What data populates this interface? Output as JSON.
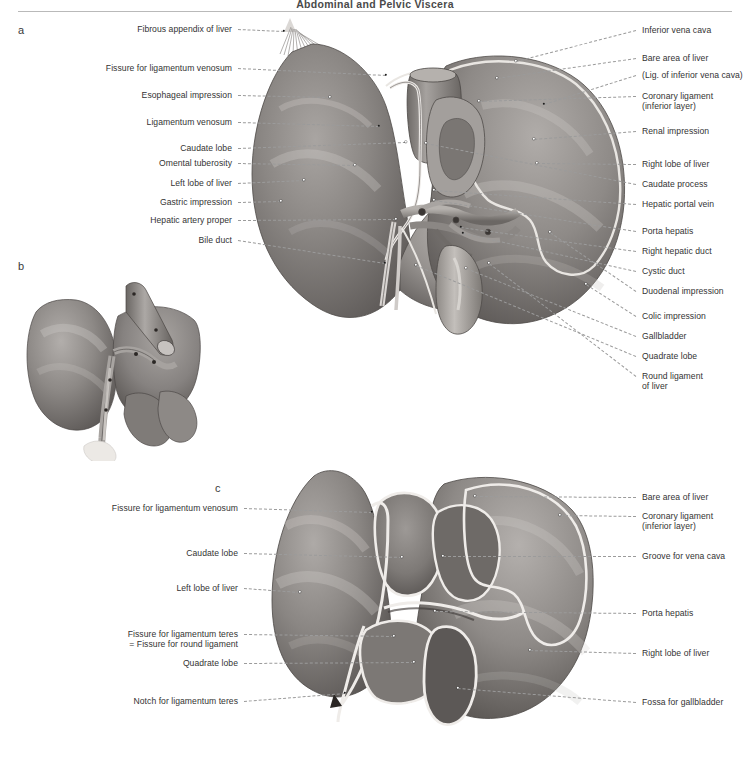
{
  "page": {
    "running_head": "Abdominal and Pelvic Viscera",
    "width": 750,
    "height": 767,
    "background": "#ffffff",
    "leader_color": "#9b9b9b",
    "text_color": "#333333"
  },
  "panels": [
    {
      "letter": "a",
      "x": 18,
      "y": 30,
      "caption": ""
    },
    {
      "letter": "b",
      "x": 18,
      "y": 266,
      "caption": ""
    },
    {
      "letter": "c",
      "x": 215,
      "y": 489,
      "caption": ""
    }
  ],
  "panel_a": {
    "letter": "a",
    "labels_left": [
      {
        "text": "Fibrous appendix of liver",
        "x": 232,
        "y": 29,
        "tx": 284,
        "ty": 31,
        "dot": "dark"
      },
      {
        "text": "Fissure for ligamentum venosum",
        "x": 232,
        "y": 68,
        "tx": 386,
        "ty": 75,
        "dot": "dark"
      },
      {
        "text": "Esophageal impression",
        "x": 232,
        "y": 95,
        "tx": 330,
        "ty": 97,
        "dot": "light"
      },
      {
        "text": "Ligamentum venosum",
        "x": 232,
        "y": 122,
        "tx": 379,
        "ty": 126,
        "dot": "dark"
      },
      {
        "text": "Caudate lobe",
        "x": 232,
        "y": 148,
        "tx": 406,
        "ty": 142,
        "dot": "light"
      },
      {
        "text": "Omental tuberosity",
        "x": 232,
        "y": 163,
        "tx": 355,
        "ty": 165,
        "dot": "light"
      },
      {
        "text": "Left lobe of liver",
        "x": 232,
        "y": 183,
        "tx": 304,
        "ty": 180,
        "dot": "light"
      },
      {
        "text": "Gastric impression",
        "x": 232,
        "y": 202,
        "tx": 281,
        "ty": 201,
        "dot": "light"
      },
      {
        "text": "Hepatic artery proper",
        "x": 232,
        "y": 220,
        "tx": 396,
        "ty": 219,
        "dot": "light"
      },
      {
        "text": "Bile duct",
        "x": 232,
        "y": 240,
        "tx": 385,
        "ty": 263,
        "dot": "dark"
      }
    ],
    "labels_right": [
      {
        "text": "Inferior vena cava",
        "x": 642,
        "y": 30,
        "tx": 516,
        "ty": 61,
        "dot": "light"
      },
      {
        "text": "Bare area of liver",
        "x": 642,
        "y": 58,
        "tx": 497,
        "ty": 78,
        "dot": "light"
      },
      {
        "text": "(Lig. of inferior vena cava)",
        "x": 642,
        "y": 75,
        "tx": 544,
        "ty": 104,
        "dot": "dark"
      },
      {
        "text": "Coronary ligament",
        "x": 642,
        "y": 96,
        "tx": 479,
        "ty": 101,
        "dot": "light"
      },
      {
        "text": "(inferior layer)",
        "x": 642,
        "y": 106,
        "tx": null,
        "ty": null,
        "dot": null
      },
      {
        "text": "Renal impression",
        "x": 642,
        "y": 131,
        "tx": 534,
        "ty": 139,
        "dot": "light"
      },
      {
        "text": "Right lobe of liver",
        "x": 642,
        "y": 164,
        "tx": 537,
        "ty": 163,
        "dot": "light"
      },
      {
        "text": "Caudate process",
        "x": 642,
        "y": 184,
        "tx": 426,
        "ty": 143,
        "dot": "light"
      },
      {
        "text": "Hepatic portal vein",
        "x": 642,
        "y": 204,
        "tx": 434,
        "ty": 190,
        "dot": "light"
      },
      {
        "text": "Porta hepatis",
        "x": 642,
        "y": 231,
        "tx": 434,
        "ty": 200,
        "dot": "light"
      },
      {
        "text": "Right hepatic duct",
        "x": 642,
        "y": 251,
        "tx": 461,
        "ty": 227,
        "dot": "dark"
      },
      {
        "text": "Cystic duct",
        "x": 642,
        "y": 271,
        "tx": 463,
        "ty": 233,
        "dot": "dark"
      },
      {
        "text": "Duodenal impression",
        "x": 642,
        "y": 291,
        "tx": 550,
        "ty": 232,
        "dot": "light"
      },
      {
        "text": "Colic impression",
        "x": 642,
        "y": 316,
        "tx": 586,
        "ty": 284,
        "dot": "light"
      },
      {
        "text": "Gallbladder",
        "x": 642,
        "y": 336,
        "tx": 466,
        "ty": 268,
        "dot": "light"
      },
      {
        "text": "Quadrate lobe",
        "x": 642,
        "y": 356,
        "tx": 416,
        "ty": 265,
        "dot": "light"
      },
      {
        "text": "Round ligament",
        "x": 642,
        "y": 376,
        "tx": 489,
        "ty": 263,
        "dot": "light"
      },
      {
        "text": "of liver",
        "x": 642,
        "y": 386,
        "tx": null,
        "ty": null,
        "dot": null
      }
    ]
  },
  "panel_b": {
    "letter": "b",
    "labels": []
  },
  "panel_c": {
    "letter": "c",
    "labels_left": [
      {
        "text": "Fissure for ligamentum venosum",
        "x": 238,
        "y": 508,
        "tx": 372,
        "ty": 512,
        "dot": "dark"
      },
      {
        "text": "Caudate lobe",
        "x": 238,
        "y": 553,
        "tx": 402,
        "ty": 557,
        "dot": "light"
      },
      {
        "text": "Left lobe of liver",
        "x": 238,
        "y": 588,
        "tx": 300,
        "ty": 592,
        "dot": "light"
      },
      {
        "text": "Fissure for ligamentum teres",
        "x": 238,
        "y": 634,
        "tx": 394,
        "ty": 636,
        "dot": "light"
      },
      {
        "text": "= Fissure for round ligament",
        "x": 238,
        "y": 644,
        "tx": null,
        "ty": null,
        "dot": null
      },
      {
        "text": "Quadrate lobe",
        "x": 238,
        "y": 663,
        "tx": 414,
        "ty": 662,
        "dot": "light"
      },
      {
        "text": "Notch for ligamentum teres",
        "x": 238,
        "y": 701,
        "tx": 345,
        "ty": 693,
        "dot": "dark"
      }
    ],
    "labels_right": [
      {
        "text": "Bare area of liver",
        "x": 642,
        "y": 497,
        "tx": 475,
        "ty": 496,
        "dot": "light"
      },
      {
        "text": "Coronary ligament",
        "x": 642,
        "y": 516,
        "tx": 560,
        "ty": 515,
        "dot": "light"
      },
      {
        "text": "(inferior layer)",
        "x": 642,
        "y": 526,
        "tx": null,
        "ty": null,
        "dot": null
      },
      {
        "text": "Groove for vena cava",
        "x": 642,
        "y": 556,
        "tx": 443,
        "ty": 556,
        "dot": "light"
      },
      {
        "text": "Porta hepatis",
        "x": 642,
        "y": 613,
        "tx": 435,
        "ty": 611,
        "dot": "light"
      },
      {
        "text": "Right lobe of liver",
        "x": 642,
        "y": 653,
        "tx": 530,
        "ty": 650,
        "dot": "light"
      },
      {
        "text": "Fossa for gallbladder",
        "x": 642,
        "y": 702,
        "tx": 458,
        "ty": 688,
        "dot": "light"
      }
    ]
  }
}
